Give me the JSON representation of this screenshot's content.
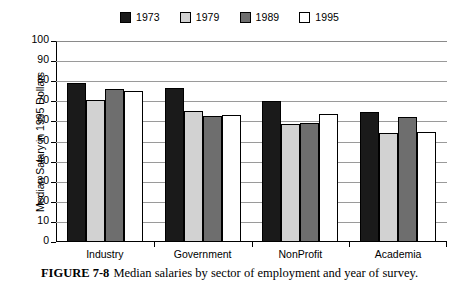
{
  "chart_data": {
    "type": "bar",
    "title": "",
    "xlabel": "",
    "ylabel": "Median Salary in 1995 Dollars",
    "ylim": [
      0,
      100
    ],
    "ytick_step": 10,
    "yticks": [
      100,
      90,
      80,
      70,
      60,
      50,
      40,
      30,
      20,
      10,
      0
    ],
    "grid": true,
    "legend_position": "top-center",
    "categories": [
      "Industry",
      "Government",
      "NonProfit",
      "Academia"
    ],
    "series": [
      {
        "name": "1973",
        "color": "#1a1a1a",
        "values": [
          79,
          76.5,
          70,
          64.5
        ]
      },
      {
        "name": "1979",
        "color": "#d2d2d2",
        "values": [
          70.5,
          65,
          58.5,
          54
        ]
      },
      {
        "name": "1989",
        "color": "#6e6e6e",
        "values": [
          76,
          62.5,
          59,
          62
        ]
      },
      {
        "name": "1995",
        "color": "#ffffff",
        "values": [
          75,
          63,
          63.5,
          54.5
        ]
      }
    ]
  },
  "caption": {
    "figure_number": "FIGURE 7-8",
    "text": "Median salaries by sector of employment and year of survey."
  }
}
